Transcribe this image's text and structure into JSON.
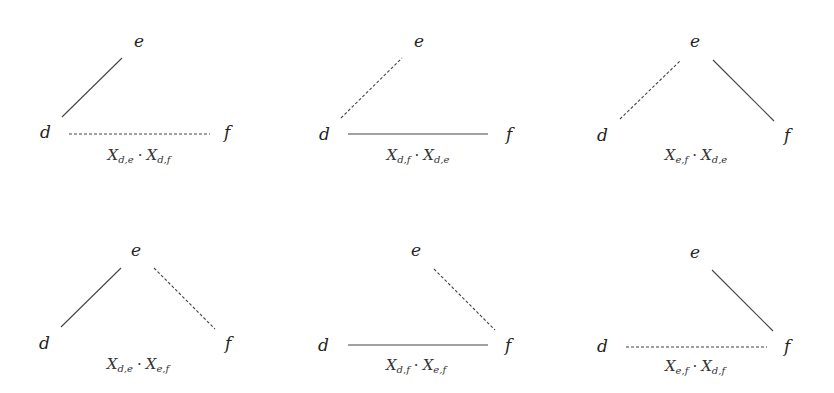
{
  "diagram": {
    "node_labels": {
      "d": "d",
      "e": "e",
      "f": "f"
    },
    "panels": [
      {
        "id": "p1",
        "layout": "top-left",
        "edges": {
          "de": "solid",
          "ef": "none",
          "df": "dashed"
        },
        "caption": {
          "a_base": "X",
          "a_sub": "d,e",
          "b_base": "X",
          "b_sub": "d,f"
        },
        "caption_text": "X_{d,e} · X_{d,f}"
      },
      {
        "id": "p2",
        "layout": "top-middle",
        "edges": {
          "de": "dashed",
          "ef": "none",
          "df": "solid"
        },
        "caption": {
          "a_base": "X",
          "a_sub": "d,f",
          "b_base": "X",
          "b_sub": "d,e"
        },
        "caption_text": "X_{d,f} · X_{d,e}"
      },
      {
        "id": "p3",
        "layout": "top-right",
        "edges": {
          "de": "dashed",
          "ef": "solid",
          "df": "none"
        },
        "caption": {
          "a_base": "X",
          "a_sub": "e,f",
          "b_base": "X",
          "b_sub": "d,e"
        },
        "caption_text": "X_{e,f} · X_{d,e}"
      },
      {
        "id": "p4",
        "layout": "bottom-left",
        "edges": {
          "de": "solid",
          "ef": "dashed",
          "df": "none"
        },
        "caption": {
          "a_base": "X",
          "a_sub": "d,e",
          "b_base": "X",
          "b_sub": "e,f"
        },
        "caption_text": "X_{d,e} · X_{e,f}"
      },
      {
        "id": "p5",
        "layout": "bottom-middle",
        "edges": {
          "de": "none",
          "ef": "dashed",
          "df": "solid"
        },
        "caption": {
          "a_base": "X",
          "a_sub": "d,f",
          "b_base": "X",
          "b_sub": "e,f"
        },
        "caption_text": "X_{d,f} · X_{e,f}"
      },
      {
        "id": "p6",
        "layout": "bottom-right",
        "edges": {
          "de": "none",
          "ef": "solid",
          "df": "dashed"
        },
        "caption": {
          "a_base": "X",
          "a_sub": "e,f",
          "b_base": "X",
          "b_sub": "d,f"
        },
        "caption_text": "X_{e,f} · X_{d,f}"
      }
    ],
    "dot_symbol": "·"
  }
}
